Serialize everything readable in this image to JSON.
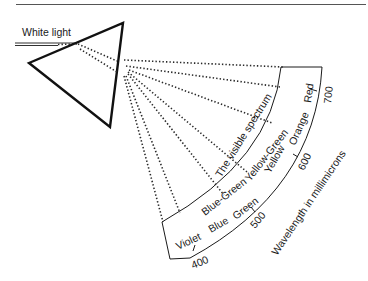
{
  "figure": {
    "title_rule": true,
    "source_label": "White light",
    "arc_title": "The visible spectrum",
    "axis_label": "Wavelength in millimicrons",
    "outer_colors": [
      "Blue-Green",
      "Yellow-Green",
      "Orange",
      "Red"
    ],
    "inner_colors": [
      "Violet",
      "Blue",
      "Green",
      "Yellow"
    ],
    "ticks": [
      "400",
      "500",
      "600",
      "700"
    ],
    "colors": {
      "line": "#1a1a1a",
      "background": "#ffffff"
    }
  }
}
